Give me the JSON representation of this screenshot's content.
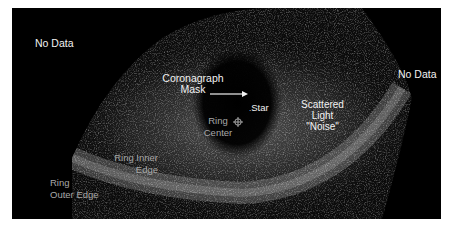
{
  "figure": {
    "colors": {
      "background": "#ffffff",
      "panel": "#000000",
      "label_primary": "#f2f2f2",
      "label_secondary": "#a8a8a8"
    },
    "labels": {
      "no_data_left": "No Data",
      "no_data_right": "No Data",
      "coronagraph_line1": "Coronagraph",
      "coronagraph_line2": "Mask",
      "star": "Star",
      "scattered_line1": "Scattered",
      "scattered_line2": "Light",
      "scattered_line3": "\"Noise\"",
      "ring_center_line1": "Ring",
      "ring_center_line2": "Center",
      "ring_inner_line1": "Ring Inner",
      "ring_inner_line2": "Edge",
      "ring_outer_line1": "Ring",
      "ring_outer_line2": "Outer Edge"
    },
    "icons": {
      "arrow": "arrow-right-icon",
      "ring_center_marker": "crosshair-icon"
    }
  }
}
